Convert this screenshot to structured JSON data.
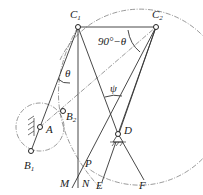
{
  "diagram": {
    "type": "mechanism-kinematic-sketch",
    "points": {
      "C1": "C1",
      "C2": "C2",
      "A": "A",
      "B1": "B1",
      "B2": "B2",
      "D": "D",
      "P": "P",
      "M": "M",
      "N": "N",
      "E": "E",
      "F": "F"
    },
    "labels": {
      "C": "C",
      "C_sub1": "1",
      "C_sub2": "2",
      "B": "B",
      "B_sub1": "1",
      "B_sub2": "2",
      "A": "A",
      "D": "D",
      "P": "P",
      "M": "M",
      "N": "N",
      "E": "E",
      "F": "F",
      "theta": "θ",
      "angle_c2": "90°−θ",
      "psi": "ψ"
    },
    "stroke_color": "#333333",
    "background": "#ffffff"
  }
}
